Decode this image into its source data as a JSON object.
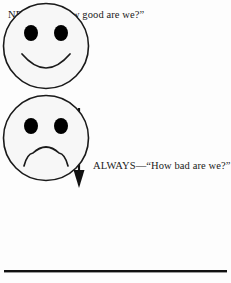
{
  "figure": {
    "background_color": "#fdfdfd",
    "ink_color": "#1a1a1a"
  },
  "labels": {
    "top": "NEVER—“How good are we?”",
    "bottom": "ALWAYS—“How bad are we?”"
  },
  "faces": {
    "happy": {
      "name": "smiling-face",
      "expression": "smile",
      "fill_color": "#f7f7f7",
      "stroke_color": "#1a1a1a",
      "eye_color": "#000000"
    },
    "sad": {
      "name": "frowning-face",
      "expression": "frown",
      "fill_color": "#f7f7f7",
      "stroke_color": "#1a1a1a",
      "eye_color": "#000000"
    }
  },
  "arrow": {
    "name": "downward-arrow",
    "direction": "down",
    "color": "#111111"
  },
  "rule": {
    "name": "bottom-horizontal-rule",
    "color": "#111111"
  }
}
